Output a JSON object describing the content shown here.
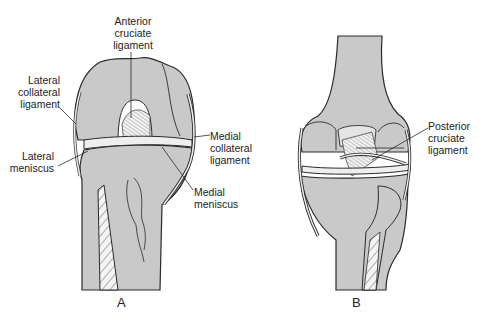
{
  "figure": {
    "colors": {
      "background": "#ffffff",
      "bone_fill": "#c9c9c9",
      "outline": "#2a2a2a",
      "ligament_fill": "#eeeeee"
    },
    "panels": [
      {
        "id": "A",
        "label": "A",
        "view": "anterior",
        "annotations": [
          {
            "id": "acl",
            "lines": [
              "Anterior",
              "cruciate",
              "ligament"
            ]
          },
          {
            "id": "lcl",
            "lines": [
              "Lateral",
              "collateral",
              "ligament"
            ]
          },
          {
            "id": "lateral-meniscus",
            "lines": [
              "Lateral",
              "meniscus"
            ]
          },
          {
            "id": "mcl",
            "lines": [
              "Medial",
              "collateral",
              "ligament"
            ]
          },
          {
            "id": "medial-meniscus",
            "lines": [
              "Medial",
              "meniscus"
            ]
          }
        ]
      },
      {
        "id": "B",
        "label": "B",
        "view": "posterior",
        "annotations": [
          {
            "id": "pcl",
            "lines": [
              "Posterior",
              "cruciate",
              "ligament"
            ]
          }
        ]
      }
    ]
  }
}
